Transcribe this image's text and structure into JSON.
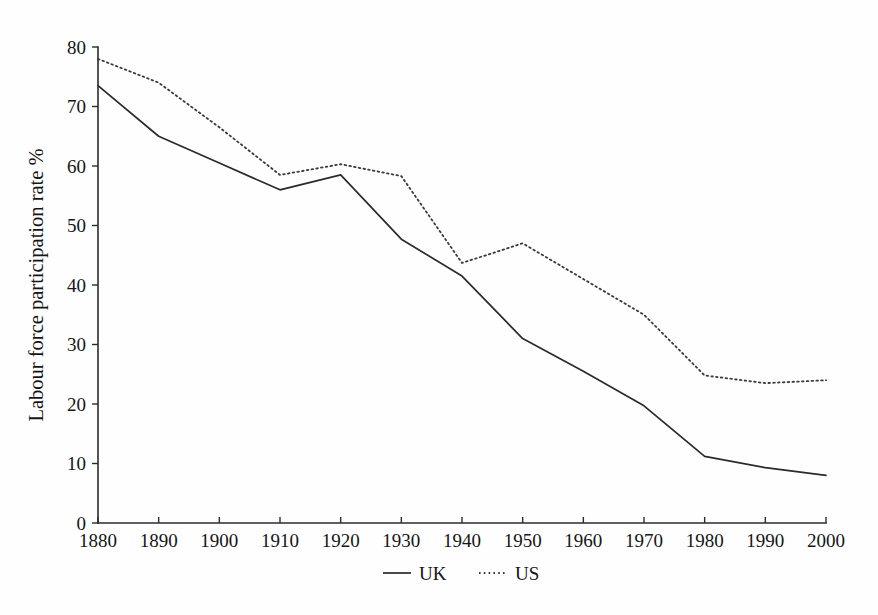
{
  "chart_data": {
    "type": "line",
    "title": "",
    "xlabel": "",
    "ylabel": "Labour force participation rate  %",
    "x": [
      1880,
      1890,
      1900,
      1910,
      1920,
      1930,
      1940,
      1950,
      1960,
      1970,
      1980,
      1990,
      2000
    ],
    "categories": [
      "1880",
      "1890",
      "1900",
      "1910",
      "1920",
      "1930",
      "1940",
      "1950",
      "1960",
      "1970",
      "1980",
      "1990",
      "2000"
    ],
    "xlim": [
      1880,
      2000
    ],
    "ylim": [
      0,
      80
    ],
    "yticks": [
      0,
      10,
      20,
      30,
      40,
      50,
      60,
      70,
      80
    ],
    "ytick_labels": [
      "0",
      "10",
      "20",
      "30",
      "40",
      "50",
      "60",
      "70",
      "80"
    ],
    "xticks": [
      1880,
      1890,
      1900,
      1910,
      1920,
      1930,
      1940,
      1950,
      1960,
      1970,
      1980,
      1990,
      2000
    ],
    "xtick_labels": [
      "1880",
      "1890",
      "1900",
      "1910",
      "1920",
      "1930",
      "1940",
      "1950",
      "1960",
      "1970",
      "1980",
      "1990",
      "2000"
    ],
    "grid": false,
    "legend_position": "bottom-center",
    "series": [
      {
        "name": "UK",
        "style": "solid",
        "color": "#2a2a2a",
        "values": [
          73.5,
          65.0,
          60.5,
          56.0,
          58.5,
          47.7,
          41.5,
          31.0,
          25.5,
          19.7,
          11.2,
          9.3,
          8.0
        ]
      },
      {
        "name": "US",
        "style": "dotted",
        "color": "#3a3a3a",
        "values": [
          78.0,
          74.0,
          66.5,
          58.5,
          60.3,
          58.3,
          43.7,
          47.0,
          41.0,
          35.0,
          24.8,
          23.5,
          24.0
        ]
      }
    ]
  },
  "legend": {
    "items": [
      {
        "label": "UK",
        "style": "solid"
      },
      {
        "label": "US",
        "style": "dotted"
      }
    ]
  }
}
